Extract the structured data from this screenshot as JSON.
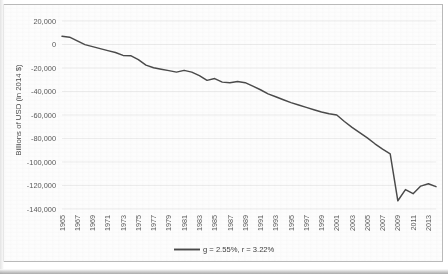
{
  "chart_data": {
    "type": "line",
    "title": "",
    "xlabel": "",
    "ylabel": "Billions of USD (in 2014 $)",
    "ylim": [
      -140000,
      20000
    ],
    "ytick_step": 20000,
    "yticks": [
      20000,
      0,
      -20000,
      -40000,
      -60000,
      -80000,
      -100000,
      -120000,
      -140000
    ],
    "ytick_labels": [
      "20,000",
      "0",
      "-20,000",
      "-40,000",
      "-60,000",
      "-80,000",
      "-100,000",
      "-120,000",
      "-140,000"
    ],
    "xlim": [
      1965,
      2014
    ],
    "xtick_step": 2,
    "xtick_labels": [
      "1965",
      "1967",
      "1969",
      "1971",
      "1973",
      "1975",
      "1977",
      "1979",
      "1981",
      "1983",
      "1985",
      "1987",
      "1989",
      "1991",
      "1993",
      "1995",
      "1997",
      "1999",
      "2001",
      "2003",
      "2005",
      "2007",
      "2009",
      "2011",
      "2013"
    ],
    "grid": "horizontal",
    "legend_position": "bottom",
    "legend": [
      "g = 2.55%, r = 3.22%"
    ],
    "series": [
      {
        "name": "g = 2.55%, r = 3.22%",
        "color": "#4a4a4a",
        "x": [
          1965,
          1966,
          1967,
          1968,
          1969,
          1970,
          1971,
          1972,
          1973,
          1974,
          1975,
          1976,
          1977,
          1978,
          1979,
          1980,
          1981,
          1982,
          1983,
          1984,
          1985,
          1986,
          1987,
          1988,
          1989,
          1990,
          1991,
          1992,
          1993,
          1994,
          1995,
          1996,
          1997,
          1998,
          1999,
          2000,
          2001,
          2002,
          2003,
          2004,
          2005,
          2006,
          2007,
          2008,
          2009,
          2010,
          2011,
          2012,
          2013,
          2014
        ],
        "values": [
          7000,
          6200,
          3000,
          -100,
          -1800,
          -3500,
          -5200,
          -6800,
          -9300,
          -9500,
          -12800,
          -17500,
          -19800,
          -21000,
          -22200,
          -23500,
          -22000,
          -23500,
          -26500,
          -30500,
          -29000,
          -32000,
          -32500,
          -31500,
          -32500,
          -35500,
          -38500,
          -42000,
          -44500,
          -47000,
          -49500,
          -51500,
          -53500,
          -55500,
          -57500,
          -59000,
          -60000,
          -65500,
          -70500,
          -75000,
          -79500,
          -84500,
          -89000,
          -93000,
          -133000,
          -123500,
          -127000,
          -120500,
          -118500,
          -121000
        ]
      }
    ]
  },
  "axis": {
    "y_title": "Billions of USD (in 2014 $)"
  },
  "legend": {
    "entry_label": "g = 2.55%, r = 3.22%"
  }
}
